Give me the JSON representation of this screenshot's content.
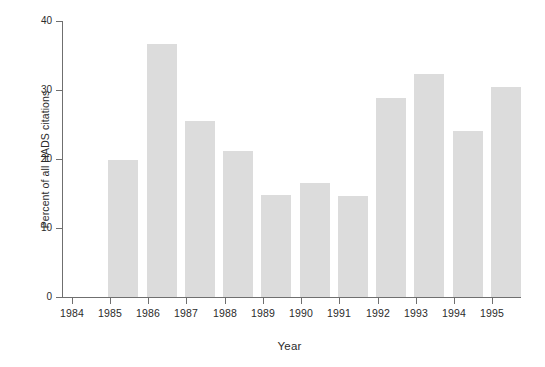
{
  "chart_data": {
    "type": "bar",
    "title": "",
    "subtitle": "",
    "xlabel": "Year",
    "ylabel": "Percent of all HADS citations",
    "categories": [
      "1984",
      "1985",
      "1986",
      "1987",
      "1988",
      "1989",
      "1990",
      "1991",
      "1992",
      "1993",
      "1994",
      "1995"
    ],
    "values": [
      0,
      19.8,
      36.7,
      25.5,
      21.2,
      14.8,
      16.5,
      14.7,
      28.9,
      32.3,
      24.0,
      30.5
    ],
    "ylim": [
      0,
      40
    ],
    "yticks": [
      0,
      10,
      20,
      30,
      40
    ],
    "ytick_labels": [
      "0",
      "10",
      "20",
      "30",
      "40"
    ],
    "grid": false,
    "legend": false,
    "legend_position": "none",
    "bar_color": "#dcdcdc",
    "axis_color": "#6f6f6f",
    "text_color": "#2b2b2b",
    "background": "#ffffff"
  }
}
